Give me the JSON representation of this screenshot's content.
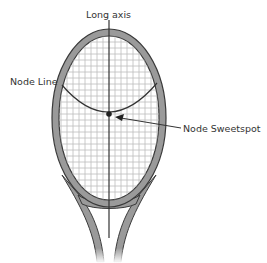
{
  "diagram": {
    "labels": {
      "long_axis": "Long axis",
      "node_line": "Node Line",
      "node_sweetspot": "Node Sweetspot"
    },
    "colors": {
      "frame_fill": "#9a9a9a",
      "frame_stroke": "#3a3a3a",
      "strings": "#b8b8b8",
      "axis": "#333333",
      "text": "#333333"
    }
  }
}
